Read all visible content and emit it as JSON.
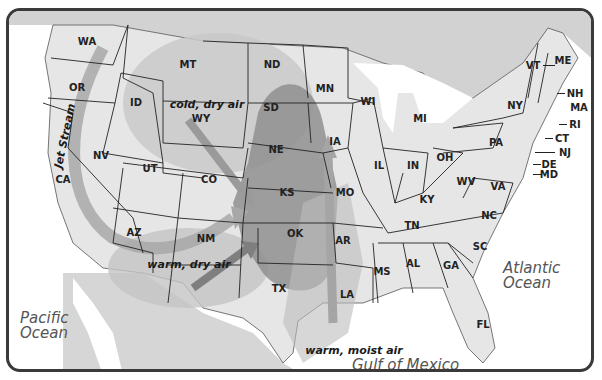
{
  "map": {
    "type": "US weather air masses map",
    "states": {
      "WA": "WA",
      "OR": "OR",
      "CA": "CA",
      "ID": "ID",
      "NV": "NV",
      "MT": "MT",
      "WY": "WY",
      "UT": "UT",
      "AZ": "AZ",
      "CO": "CO",
      "NM": "NM",
      "ND": "ND",
      "SD": "SD",
      "NE": "NE",
      "KS": "KS",
      "OK": "OK",
      "TX": "TX",
      "MN": "MN",
      "IA": "IA",
      "MO": "MO",
      "AR": "AR",
      "LA": "LA",
      "WI": "WI",
      "IL": "IL",
      "MI": "MI",
      "IN": "IN",
      "OH": "OH",
      "KY": "KY",
      "TN": "TN",
      "MS": "MS",
      "AL": "AL",
      "GA": "GA",
      "FL": "FL",
      "SC": "SC",
      "NC": "NC",
      "VA": "VA",
      "WV": "WV",
      "PA": "PA",
      "NY": "NY",
      "VT": "VT",
      "NH": "NH",
      "ME": "ME",
      "MA": "MA",
      "RI": "RI",
      "CT": "CT",
      "NJ": "NJ",
      "DE": "DE",
      "MD": "MD"
    },
    "air_masses": {
      "cold_dry": "cold, dry air",
      "warm_dry": "warm, dry air",
      "warm_moist": "warm, moist air"
    },
    "jet_stream": "Jet Stream",
    "oceans": {
      "pacific_line1": "Pacific",
      "pacific_line2": "Ocean",
      "atlantic_line1": "Atlantic",
      "atlantic_line2": "Ocean",
      "gulf": "Gulf of Mexico"
    },
    "colors": {
      "land": "#e6e6e6",
      "outside_land": "#d2d2d2",
      "light_air": "#c9c9c9",
      "dark_air": "#8f8f8f",
      "arrow": "#9a9a9a",
      "border": "#222222",
      "frame": "#3a3a3a"
    }
  }
}
